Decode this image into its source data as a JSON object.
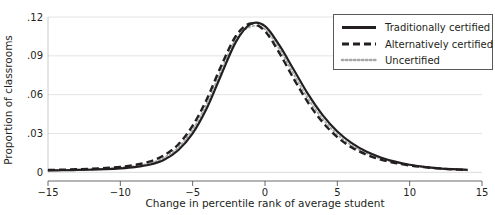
{
  "chart_data": {
    "type": "line",
    "title": "",
    "xlabel": "Change in percentile rank of average student",
    "ylabel": "Proportion of classrooms",
    "xlim": [
      -15,
      15
    ],
    "ylim": [
      0,
      0.12
    ],
    "xticks": [
      "-15",
      "-10",
      "-5",
      "0",
      "5",
      "10",
      "15"
    ],
    "xtick_values": [
      -15,
      -10,
      -5,
      0,
      5,
      10,
      15
    ],
    "yticks": [
      "0",
      ".03",
      ".06",
      ".09",
      ".12"
    ],
    "ytick_values": [
      0,
      0.03,
      0.06,
      0.09,
      0.12
    ],
    "grid": "horizontal",
    "legend_position": "top-right",
    "x": [
      -15,
      -14,
      -13,
      -12,
      -11,
      -10,
      -9,
      -8,
      -7,
      -6,
      -5,
      -4,
      -3,
      -2,
      -1,
      0,
      1,
      2,
      3,
      4,
      5,
      6,
      7,
      8,
      9,
      10,
      11,
      12,
      13,
      14
    ],
    "series": [
      {
        "name": "Traditionally certified",
        "style": "solid",
        "color": "#231f20",
        "values": [
          0.0015,
          0.0016,
          0.0018,
          0.002,
          0.0024,
          0.003,
          0.004,
          0.0058,
          0.0095,
          0.017,
          0.03,
          0.05,
          0.076,
          0.101,
          0.1145,
          0.113,
          0.098,
          0.079,
          0.06,
          0.044,
          0.0315,
          0.0225,
          0.016,
          0.0115,
          0.0082,
          0.0058,
          0.0042,
          0.0031,
          0.0024,
          0.0019
        ]
      },
      {
        "name": "Alternatively certified",
        "style": "dashed",
        "color": "#231f20",
        "values": [
          0.0018,
          0.002,
          0.0023,
          0.0027,
          0.0033,
          0.0042,
          0.0057,
          0.0082,
          0.013,
          0.0215,
          0.036,
          0.057,
          0.083,
          0.1055,
          0.115,
          0.109,
          0.092,
          0.072,
          0.0535,
          0.0385,
          0.0272,
          0.0192,
          0.0137,
          0.0098,
          0.0072,
          0.0053,
          0.004,
          0.003,
          0.0023,
          0.0018
        ]
      },
      {
        "name": "Uncertified",
        "style": "dotted",
        "color": "#a7a9ac",
        "values": [
          0.0016,
          0.0018,
          0.002,
          0.0023,
          0.0028,
          0.0036,
          0.0048,
          0.0069,
          0.0112,
          0.0192,
          0.033,
          0.0535,
          0.0795,
          0.103,
          0.1125,
          0.1105,
          0.095,
          0.0755,
          0.0565,
          0.0412,
          0.0292,
          0.0207,
          0.0148,
          0.0106,
          0.0077,
          0.0056,
          0.0041,
          0.0031,
          0.0024,
          0.0019
        ]
      }
    ]
  }
}
